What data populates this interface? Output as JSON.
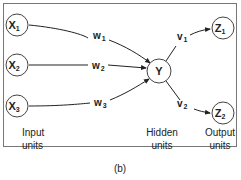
{
  "diagram": {
    "type": "neural-network",
    "nodes": {
      "x1": {
        "main": "X",
        "sub": "1"
      },
      "x2": {
        "main": "X",
        "sub": "2"
      },
      "x3": {
        "main": "X",
        "sub": "3"
      },
      "y": {
        "main": "Y",
        "sub": ""
      },
      "z1": {
        "main": "Z",
        "sub": "1"
      },
      "z2": {
        "main": "Z",
        "sub": "2"
      }
    },
    "weights": {
      "w1": {
        "main": "w",
        "sub": "1"
      },
      "w2": {
        "main": "w",
        "sub": "2"
      },
      "w3": {
        "main": "w",
        "sub": "3"
      },
      "v1": {
        "main": "v",
        "sub": "1"
      },
      "v2": {
        "main": "v",
        "sub": "2"
      }
    },
    "layer_labels": {
      "input": [
        "Input",
        "units"
      ],
      "hidden": [
        "Hidden",
        "units"
      ],
      "output": [
        "Output",
        "units"
      ]
    },
    "caption": "(b)"
  }
}
